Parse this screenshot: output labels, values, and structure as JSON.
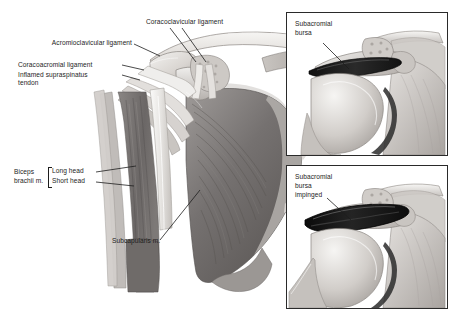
{
  "figure": {
    "background_color": "#ffffff",
    "width": 455,
    "height": 321
  },
  "main_illustration": {
    "name": "anterior shoulder dissection",
    "labels": [
      {
        "id": "coracoclavicular",
        "text": "Coracoclavicular ligament"
      },
      {
        "id": "acromioclavicular",
        "text": "Acromioclavicular ligament"
      },
      {
        "id": "coracoacromial",
        "text": "Coracoacromial ligament"
      },
      {
        "id": "supraspinatus_line1",
        "text": "Inflamed supraspinatus"
      },
      {
        "id": "supraspinatus_line2",
        "text": "tendon"
      },
      {
        "id": "biceps_line1",
        "text": "Biceps"
      },
      {
        "id": "biceps_line2",
        "text": "brachii m."
      },
      {
        "id": "long_head",
        "text": "Long head"
      },
      {
        "id": "short_head",
        "text": "Short head"
      },
      {
        "id": "subcapularis",
        "text": "Subcapularis m."
      }
    ]
  },
  "inset_top": {
    "label_line1": "Subacromial",
    "label_line2": "bursa",
    "border_color": "#2a2a2a"
  },
  "inset_bottom": {
    "label_line1": "Subacromial",
    "label_line2": "bursa",
    "label_line3": "impinged",
    "border_color": "#2a2a2a"
  },
  "palette": {
    "bone_light": "#e8e6e4",
    "bone_mid": "#cfcbc7",
    "bone_shadow": "#a9a4a0",
    "muscle_dark": "#6e6a68",
    "muscle_mid": "#8d8987",
    "muscle_light": "#b3afac",
    "tendon": "#f2f1ef",
    "bursa_dark": "#1a1a1a",
    "outline": "#5e5a57",
    "text": "#1d1d1d"
  }
}
